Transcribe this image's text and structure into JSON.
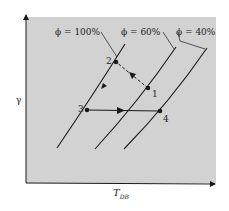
{
  "diagram": {
    "title": "",
    "colors": {
      "background": "#ffffff",
      "plot_area": "#d2d2d2",
      "ink": "#1a1a1a"
    },
    "axes": {
      "y_label": "γ",
      "x_label_main": "T",
      "x_label_sub": "DB"
    },
    "curves": [
      {
        "label": "ϕ = 100%",
        "id": "phi-100"
      },
      {
        "label": "ϕ = 60%",
        "id": "phi-60"
      },
      {
        "label": "ϕ = 40%",
        "id": "phi-40"
      }
    ],
    "points": [
      {
        "label": "1"
      },
      {
        "label": "2"
      },
      {
        "label": "3"
      },
      {
        "label": "4"
      }
    ],
    "processes": [
      {
        "from": "1",
        "to": "2",
        "style": "dashed"
      },
      {
        "from": "2",
        "to": "3",
        "style": "solid"
      },
      {
        "from": "3",
        "to": "4",
        "style": "solid"
      }
    ]
  }
}
